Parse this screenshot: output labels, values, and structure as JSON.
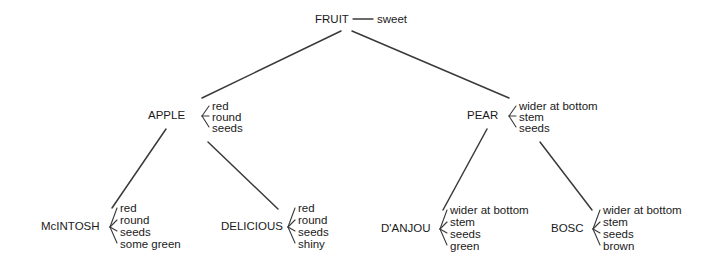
{
  "diagram": {
    "type": "semantic-network-tree",
    "title_text": "",
    "background_color": "#ffffff",
    "line_color": "#3a3a3a",
    "text_color": "#1a1a1a",
    "root": {
      "label": "FRUIT",
      "property": "sweet",
      "x": 315,
      "y": 23
    },
    "level2": [
      {
        "label": "APPLE",
        "label_x": 148,
        "label_y": 119,
        "bracket_x": 202,
        "attr_x": 212,
        "attributes": [
          "red",
          "round",
          "seeds"
        ]
      },
      {
        "label": "PEAR",
        "label_x": 467,
        "label_y": 119,
        "bracket_x": 509,
        "attr_x": 519,
        "attributes": [
          "wider at bottom",
          "stem",
          "seeds"
        ]
      }
    ],
    "level3": [
      {
        "label": "McINTOSH",
        "label_x": 41,
        "label_y": 230,
        "bracket_x": 110,
        "attr_x": 120,
        "attributes": [
          "red",
          "round",
          "seeds",
          "some green"
        ]
      },
      {
        "label": "DELICIOUS",
        "label_x": 221,
        "label_y": 230,
        "bracket_x": 288,
        "attr_x": 298,
        "attributes": [
          "red",
          "round",
          "seeds",
          "shiny"
        ]
      },
      {
        "label": "D'ANJOU",
        "label_x": 381,
        "label_y": 232,
        "bracket_x": 440,
        "attr_x": 450,
        "attributes": [
          "wider at bottom",
          "stem",
          "seeds",
          "green"
        ]
      },
      {
        "label": "BOSC",
        "label_x": 551,
        "label_y": 232,
        "bracket_x": 593,
        "attr_x": 603,
        "attributes": [
          "wider at bottom",
          "stem",
          "seeds",
          "brown"
        ]
      }
    ]
  }
}
